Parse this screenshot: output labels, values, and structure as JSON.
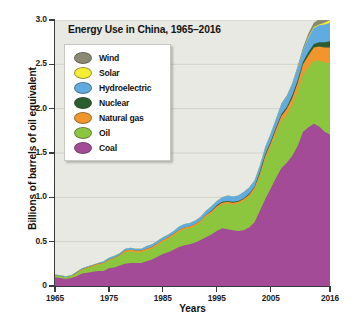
{
  "chart_data": {
    "type": "area",
    "stacked": true,
    "title": "Energy Use in China, 1965–2016",
    "xlabel": "Years",
    "ylabel": "Billions of barrels of oil equivalent",
    "xlim": [
      1965,
      2016
    ],
    "ylim": [
      0,
      3.0
    ],
    "x_ticks": [
      "1965",
      "1975",
      "1985",
      "1995",
      "2005",
      "2016"
    ],
    "x_tick_values": [
      1965,
      1975,
      1985,
      1995,
      2005,
      2016
    ],
    "y_ticks": [
      "0",
      "0.5",
      "1.0",
      "1.5",
      "2.0",
      "2.5",
      "3.0"
    ],
    "y_tick_values": [
      0,
      0.5,
      1.0,
      1.5,
      2.0,
      2.5,
      3.0
    ],
    "grid": "horizontal",
    "legend_position": "upper-left-inside",
    "plot_background": "#e9e9e3",
    "x": [
      1965,
      1966,
      1967,
      1968,
      1969,
      1970,
      1971,
      1972,
      1973,
      1974,
      1975,
      1976,
      1977,
      1978,
      1979,
      1980,
      1981,
      1982,
      1983,
      1984,
      1985,
      1986,
      1987,
      1988,
      1989,
      1990,
      1991,
      1992,
      1993,
      1994,
      1995,
      1996,
      1997,
      1998,
      1999,
      2000,
      2001,
      2002,
      2003,
      2004,
      2005,
      2006,
      2007,
      2008,
      2009,
      2010,
      2011,
      2012,
      2013,
      2014,
      2015,
      2016
    ],
    "stack_order_bottom_to_top": [
      "Coal",
      "Oil",
      "Natural gas",
      "Nuclear",
      "Hydroelectric",
      "Solar",
      "Wind"
    ],
    "series": [
      {
        "name": "Coal",
        "color": "#a34b96",
        "values": [
          0.1,
          0.09,
          0.08,
          0.09,
          0.11,
          0.14,
          0.15,
          0.16,
          0.17,
          0.17,
          0.2,
          0.21,
          0.23,
          0.25,
          0.26,
          0.26,
          0.26,
          0.28,
          0.3,
          0.33,
          0.36,
          0.38,
          0.41,
          0.44,
          0.46,
          0.47,
          0.49,
          0.52,
          0.55,
          0.58,
          0.62,
          0.65,
          0.64,
          0.63,
          0.62,
          0.63,
          0.66,
          0.72,
          0.85,
          0.98,
          1.1,
          1.22,
          1.33,
          1.39,
          1.47,
          1.58,
          1.74,
          1.79,
          1.83,
          1.8,
          1.74,
          1.71
        ]
      },
      {
        "name": "Oil",
        "color": "#8cc63e",
        "values": [
          0.02,
          0.02,
          0.02,
          0.02,
          0.03,
          0.04,
          0.05,
          0.06,
          0.07,
          0.08,
          0.09,
          0.1,
          0.11,
          0.13,
          0.13,
          0.12,
          0.12,
          0.12,
          0.12,
          0.13,
          0.14,
          0.15,
          0.16,
          0.17,
          0.18,
          0.18,
          0.19,
          0.2,
          0.23,
          0.24,
          0.26,
          0.27,
          0.29,
          0.29,
          0.31,
          0.33,
          0.34,
          0.36,
          0.39,
          0.45,
          0.47,
          0.5,
          0.53,
          0.54,
          0.57,
          0.61,
          0.64,
          0.68,
          0.71,
          0.74,
          0.78,
          0.8
        ]
      },
      {
        "name": "Natural gas",
        "color": "#f0962c",
        "values": [
          0.0,
          0.0,
          0.0,
          0.0,
          0.01,
          0.01,
          0.01,
          0.01,
          0.01,
          0.01,
          0.01,
          0.01,
          0.01,
          0.02,
          0.02,
          0.02,
          0.02,
          0.02,
          0.02,
          0.02,
          0.02,
          0.02,
          0.02,
          0.02,
          0.02,
          0.02,
          0.02,
          0.02,
          0.02,
          0.02,
          0.02,
          0.02,
          0.02,
          0.02,
          0.02,
          0.02,
          0.03,
          0.03,
          0.03,
          0.04,
          0.04,
          0.05,
          0.06,
          0.07,
          0.08,
          0.1,
          0.12,
          0.13,
          0.15,
          0.16,
          0.17,
          0.18
        ]
      },
      {
        "name": "Nuclear",
        "color": "#2b5d2e",
        "values": [
          0.0,
          0.0,
          0.0,
          0.0,
          0.0,
          0.0,
          0.0,
          0.0,
          0.0,
          0.0,
          0.0,
          0.0,
          0.0,
          0.0,
          0.0,
          0.0,
          0.0,
          0.0,
          0.0,
          0.0,
          0.0,
          0.0,
          0.0,
          0.0,
          0.0,
          0.0,
          0.0,
          0.0,
          0.0,
          0.01,
          0.01,
          0.01,
          0.01,
          0.01,
          0.01,
          0.01,
          0.01,
          0.01,
          0.02,
          0.02,
          0.02,
          0.02,
          0.02,
          0.02,
          0.03,
          0.03,
          0.03,
          0.04,
          0.04,
          0.05,
          0.06,
          0.07
        ]
      },
      {
        "name": "Hydroelectric",
        "color": "#60abe0",
        "values": [
          0.01,
          0.01,
          0.01,
          0.01,
          0.01,
          0.01,
          0.01,
          0.01,
          0.01,
          0.02,
          0.02,
          0.02,
          0.02,
          0.02,
          0.02,
          0.02,
          0.02,
          0.03,
          0.03,
          0.03,
          0.03,
          0.03,
          0.03,
          0.04,
          0.04,
          0.04,
          0.04,
          0.04,
          0.05,
          0.05,
          0.05,
          0.05,
          0.06,
          0.06,
          0.06,
          0.07,
          0.07,
          0.07,
          0.07,
          0.08,
          0.09,
          0.1,
          0.11,
          0.12,
          0.13,
          0.14,
          0.13,
          0.16,
          0.18,
          0.19,
          0.2,
          0.21
        ]
      },
      {
        "name": "Solar",
        "color": "#f5ed33",
        "values": [
          0.0,
          0.0,
          0.0,
          0.0,
          0.0,
          0.0,
          0.0,
          0.0,
          0.0,
          0.0,
          0.0,
          0.0,
          0.0,
          0.0,
          0.0,
          0.0,
          0.0,
          0.0,
          0.0,
          0.0,
          0.0,
          0.0,
          0.0,
          0.0,
          0.0,
          0.0,
          0.0,
          0.0,
          0.0,
          0.0,
          0.0,
          0.0,
          0.0,
          0.0,
          0.0,
          0.0,
          0.0,
          0.0,
          0.0,
          0.0,
          0.0,
          0.0,
          0.0,
          0.0,
          0.0,
          0.0,
          0.0,
          0.01,
          0.01,
          0.01,
          0.02,
          0.03
        ]
      },
      {
        "name": "Wind",
        "color": "#8a8a72",
        "values": [
          0.0,
          0.0,
          0.0,
          0.0,
          0.0,
          0.0,
          0.0,
          0.0,
          0.0,
          0.0,
          0.0,
          0.0,
          0.0,
          0.0,
          0.0,
          0.0,
          0.0,
          0.0,
          0.0,
          0.0,
          0.0,
          0.0,
          0.0,
          0.0,
          0.0,
          0.0,
          0.0,
          0.0,
          0.0,
          0.0,
          0.0,
          0.0,
          0.0,
          0.0,
          0.0,
          0.0,
          0.0,
          0.0,
          0.0,
          0.0,
          0.0,
          0.0,
          0.01,
          0.01,
          0.01,
          0.02,
          0.03,
          0.04,
          0.05,
          0.06,
          0.07,
          0.08
        ]
      }
    ]
  },
  "legend": {
    "items": [
      {
        "label": "Wind",
        "color": "#8a8a72"
      },
      {
        "label": "Solar",
        "color": "#f5ed33"
      },
      {
        "label": "Hydroelectric",
        "color": "#60abe0"
      },
      {
        "label": "Nuclear",
        "color": "#2b5d2e"
      },
      {
        "label": "Natural gas",
        "color": "#f0962c"
      },
      {
        "label": "Oil",
        "color": "#8cc63e"
      },
      {
        "label": "Coal",
        "color": "#a34b96"
      }
    ]
  }
}
